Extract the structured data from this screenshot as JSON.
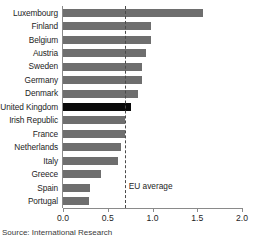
{
  "chart_data": {
    "type": "bar",
    "orientation": "horizontal",
    "title": "",
    "xlabel": "",
    "ylabel": "",
    "xlim": [
      0.0,
      2.0
    ],
    "grid": false,
    "legend": null,
    "categories": [
      "Luxembourg",
      "Finland",
      "Belgium",
      "Austria",
      "Sweden",
      "Germany",
      "Denmark",
      "United Kingdom",
      "Irish Republic",
      "France",
      "Netherlands",
      "Italy",
      "Greece",
      "Spain",
      "Portugal"
    ],
    "values": [
      1.56,
      0.98,
      0.98,
      0.93,
      0.88,
      0.88,
      0.84,
      0.76,
      0.69,
      0.69,
      0.65,
      0.61,
      0.43,
      0.3,
      0.29
    ],
    "highlighted_category": "United Kingdom",
    "bar_color": "#6e6e6e",
    "highlight_color": "#0a0a0a",
    "xticks": [
      "0.0",
      "0.5",
      "1.0",
      "1.5",
      "2.0"
    ],
    "xtick_values": [
      0.0,
      0.5,
      1.0,
      1.5,
      2.0
    ],
    "annotations": [
      {
        "name": "eu-average",
        "label": "EU average",
        "value": 0.69,
        "style": "dashed-vertical-line"
      }
    ]
  },
  "source_note": "Source: International Research",
  "colors": {
    "bar": "#6e6e6e",
    "highlight": "#0a0a0a",
    "axis": "#8a8a8a",
    "text": "#1d1d1d",
    "background": "#ffffff"
  }
}
